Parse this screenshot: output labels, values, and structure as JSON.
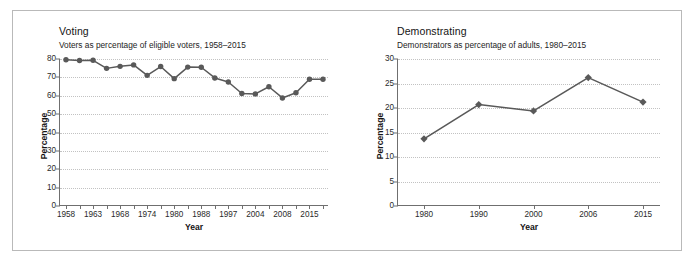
{
  "figure": {
    "background": "#ffffff",
    "frame_color": "#b9b9b9",
    "series_color": "#595959",
    "grid_color": "#c2c2c2"
  },
  "charts": [
    {
      "key": "voting",
      "title": "Voting",
      "subtitle": "Voters as percentage of eligible voters, 1958–2015",
      "xlabel": "Year",
      "ylabel": "Percentage"
    },
    {
      "key": "demonstrating",
      "title": "Demonstrating",
      "subtitle": "Demonstrators as percentage of adults, 1980–2015",
      "xlabel": "Year",
      "ylabel": "Percentage"
    }
  ],
  "chart_data": [
    {
      "type": "line",
      "title": "Voting",
      "subtitle": "Voters as percentage of eligible voters, 1958–2015",
      "xlabel": "Year",
      "ylabel": "Percentage",
      "ylim": [
        0,
        80
      ],
      "yticks": [
        0,
        10,
        20,
        30,
        40,
        50,
        60,
        70,
        80
      ],
      "xtick_labels": [
        "1958",
        "",
        "1963",
        "",
        "1968",
        "",
        "1974",
        "",
        "1980",
        "",
        "1988",
        "",
        "1997",
        "",
        "2004",
        "",
        "2008",
        "",
        "2015",
        ""
      ],
      "grid": true,
      "legend": "none",
      "marker": "circle",
      "x": [
        "1958",
        "1960",
        "1963",
        "1965",
        "1968",
        "1971",
        "1974",
        "1977",
        "1980",
        "1984",
        "1988",
        "1992",
        "1997",
        "2000",
        "2004",
        "2006",
        "2008",
        "2011",
        "2015",
        "2017"
      ],
      "values": [
        79.6,
        79.2,
        79.3,
        74.9,
        76.0,
        76.8,
        71.1,
        75.9,
        69.3,
        75.6,
        75.5,
        69.7,
        67.5,
        61.2,
        61.0,
        64.9,
        58.8,
        61.6,
        69.0,
        69.0
      ]
    },
    {
      "type": "line",
      "title": "Demonstrating",
      "subtitle": "Demonstrators as percentage of adults, 1980–2015",
      "xlabel": "Year",
      "ylabel": "Percentage",
      "ylim": [
        0,
        30
      ],
      "yticks": [
        0,
        5,
        10,
        15,
        20,
        25,
        30
      ],
      "xtick_labels": [
        "1980",
        "1990",
        "2000",
        "2006",
        "2015"
      ],
      "grid": true,
      "legend": "none",
      "marker": "diamond",
      "x": [
        "1980",
        "1990",
        "2000",
        "2006",
        "2015"
      ],
      "values": [
        13.7,
        20.7,
        19.4,
        26.2,
        21.2
      ]
    }
  ]
}
